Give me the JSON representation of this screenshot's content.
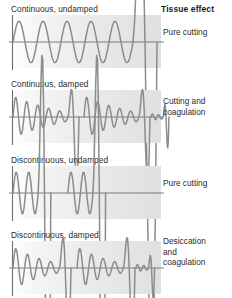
{
  "figure": {
    "title_column_header": "Tissue effect",
    "rows": [
      {
        "id": "continuous-undamped",
        "waveform_label": "Continuous, undamped",
        "tissue_effect": "Pure cutting",
        "waveform_type": "continuous-undamped",
        "top": 4,
        "label_top": 27,
        "cycles": 6,
        "damped": false,
        "discontinuous": false
      },
      {
        "id": "continuous-damped",
        "waveform_label": "Continuous, damped",
        "tissue_effect": "Cutting and\ncoagulation",
        "waveform_type": "continuous-damped",
        "top": 79,
        "label_top": 96,
        "cycles": 6,
        "damped": true,
        "discontinuous": false
      },
      {
        "id": "discontinuous-undamped",
        "waveform_label": "Discontinuous, undamped",
        "tissue_effect": "Pure cutting",
        "waveform_type": "discontinuous-undamped",
        "top": 155,
        "label_top": 178,
        "cycles": 3,
        "damped": false,
        "discontinuous": true
      },
      {
        "id": "discontinuous-damped",
        "waveform_label": "Discontinuous, damped",
        "tissue_effect": "Desiccation\nand\ncoagulation",
        "waveform_type": "discontinuous-damped",
        "top": 230,
        "label_top": 236,
        "cycles": 5,
        "damped": true,
        "discontinuous": true
      }
    ]
  },
  "chart_data": {
    "type": "line",
    "xlabel": "",
    "ylabel": "",
    "legend_position": "right",
    "grid": false,
    "colors": {
      "wave_stroke": "#8c8c8c",
      "axis_stroke": "#6e6e6e",
      "panel_background_left": "#fdfdfd",
      "panel_background_right": "#e0e0e0",
      "text": "#2b2b2b"
    },
    "series": [
      {
        "name": "Continuous, undamped",
        "annotation": "Pure cutting",
        "duty_cycle_percent": 100,
        "damping": "none",
        "amplitude_envelope": [
          1,
          1,
          1,
          1,
          1,
          1
        ],
        "cycles": 6
      },
      {
        "name": "Continuous, damped",
        "annotation": "Cutting and coagulation",
        "duty_cycle_percent": 100,
        "damping": "moderate",
        "amplitude_envelope": [
          1,
          0.78,
          0.6,
          0.45,
          0.32,
          0.2
        ],
        "bursts": 2,
        "cycles_per_burst": 6
      },
      {
        "name": "Discontinuous, undamped",
        "annotation": "Pure cutting",
        "duty_cycle_percent": 50,
        "damping": "none",
        "amplitude_envelope": [
          1,
          1,
          1
        ],
        "bursts": 2,
        "cycles_per_burst": 3
      },
      {
        "name": "Discontinuous, damped",
        "annotation": "Desiccation and coagulation",
        "duty_cycle_percent": 6,
        "damping": "high",
        "amplitude_envelope": [
          1,
          0.72,
          0.5,
          0.34,
          0.22
        ],
        "bursts": 2,
        "cycles_per_burst": 5
      }
    ]
  }
}
